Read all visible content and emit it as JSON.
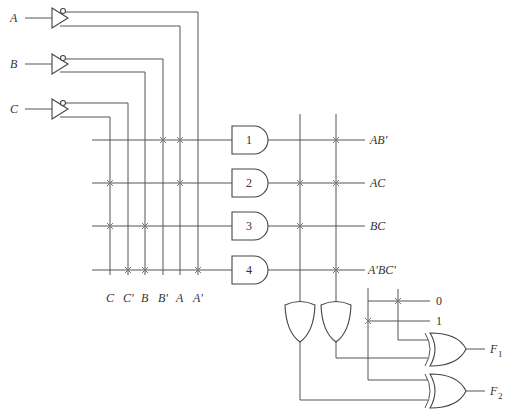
{
  "inputs": [
    "A",
    "B",
    "C"
  ],
  "column_labels": [
    "C",
    "C'",
    "B",
    "B'",
    "A",
    "A'"
  ],
  "and_gates": [
    "1",
    "2",
    "3",
    "4"
  ],
  "product_terms": [
    "AB'",
    "AC",
    "BC",
    "A'BC'"
  ],
  "constants": [
    "0",
    "1"
  ],
  "outputs": [
    "F1",
    "F2"
  ],
  "output_sub": [
    "1",
    "2"
  ]
}
